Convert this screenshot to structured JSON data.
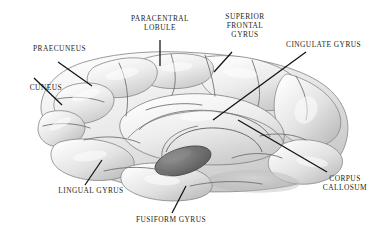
{
  "figure": {
    "background_color": "#ffffff",
    "label_color": "#231f20",
    "leader_line_color": "#111111",
    "brain_fill_light": "#f2f2f2",
    "brain_fill_mid": "#d8d8d8",
    "brain_fill_dark": "#9a9a9a",
    "brainstem_color": "#6f6f6f",
    "sulcus_line_color": "#6b6b6b"
  },
  "labels": {
    "praecuneus": "Praecuneus",
    "cuneus": "Cuneus",
    "paracentral_lobule": "Paracentral\nLobule",
    "superior_frontal_gyrus": "Superior\nFrontal\nGyrus",
    "cingulate_gyrus": "Cingulate Gyrus",
    "corpus_callosum": "Corpus\nCallosum",
    "lingual_gyrus": "Lingual Gyrus",
    "fusiform_gyrus": "Fusiform Gyrus"
  },
  "anatomy": {
    "structures": [
      {
        "name": "praecuneus",
        "label": "Praecuneus",
        "lobe": "parietal"
      },
      {
        "name": "cuneus",
        "label": "Cuneus",
        "lobe": "occipital"
      },
      {
        "name": "paracentral-lobule",
        "label": "Paracentral Lobule",
        "lobe": "frontal-parietal"
      },
      {
        "name": "superior-frontal-gyrus",
        "label": "Superior Frontal Gyrus",
        "lobe": "frontal"
      },
      {
        "name": "cingulate-gyrus",
        "label": "Cingulate Gyrus",
        "lobe": "limbic"
      },
      {
        "name": "corpus-callosum",
        "label": "Corpus Callosum",
        "lobe": "commissural"
      },
      {
        "name": "lingual-gyrus",
        "label": "Lingual Gyrus",
        "lobe": "occipital"
      },
      {
        "name": "fusiform-gyrus",
        "label": "Fusiform Gyrus",
        "lobe": "temporal-occipital"
      }
    ]
  }
}
